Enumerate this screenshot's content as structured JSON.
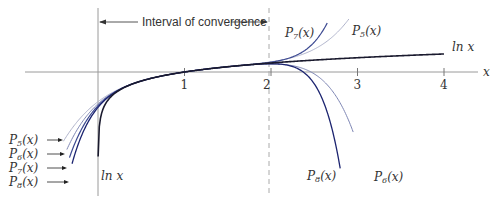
{
  "title": "Interval of convergence",
  "axis": {
    "x_label": "x",
    "ticks": [
      "1",
      "2",
      "3",
      "4"
    ],
    "tick_values": [
      1,
      2,
      3,
      4
    ]
  },
  "interval_label": "Interval of convergence",
  "interval": [
    0,
    2
  ],
  "labels": {
    "ln_right": "ln x",
    "ln_bottom": "ln x",
    "p7_top": "P7(x)",
    "p5_top": "P5(x)",
    "p8_bottom": "P8(x)",
    "p6_bottom": "P6(x)",
    "left_list": [
      "P5(x)",
      "P6(x)",
      "P7(x)",
      "P8(x)"
    ]
  },
  "colors": {
    "ln": "#1a1a2e",
    "P5": "#b0b4cc",
    "P6": "#7e86b4",
    "P7": "#3d4a92",
    "P8": "#1c2470",
    "axis": "#999999",
    "dashed": "#aaaaaa"
  },
  "chart_data": {
    "type": "line",
    "xlabel": "x",
    "ylabel": "",
    "xlim": [
      -0.8,
      4.4
    ],
    "series": [
      {
        "name": "ln x",
        "function": "ln(x)",
        "domain": [
          0.02,
          4.0
        ]
      },
      {
        "name": "P5(x)",
        "degree": 5,
        "domain": [
          -0.35,
          2.9
        ]
      },
      {
        "name": "P6(x)",
        "degree": 6,
        "domain": [
          -0.3,
          2.95
        ]
      },
      {
        "name": "P7(x)",
        "degree": 7,
        "domain": [
          -0.25,
          2.6
        ]
      },
      {
        "name": "P8(x)",
        "degree": 8,
        "domain": [
          -0.2,
          2.75
        ]
      }
    ],
    "annotations": [
      "Interval of convergence (0, 2]",
      "dashed line at x = 2"
    ]
  }
}
